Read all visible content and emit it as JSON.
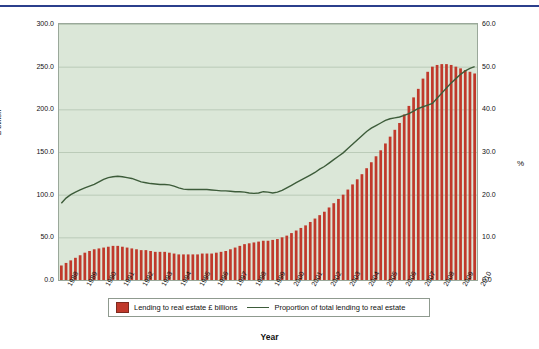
{
  "chart_data": {
    "type": "bar",
    "title": "",
    "xlabel": "Year",
    "ylabel": "£ billion",
    "ylabel_right": "%",
    "ylim": [
      0,
      300
    ],
    "ylim_right": [
      0,
      60
    ],
    "yticks": [
      "0.0",
      "50.0",
      "100.0",
      "150.0",
      "200.0",
      "250.0",
      "300.0"
    ],
    "yticks_right": [
      "0.0",
      "10.0",
      "20.0",
      "30.0",
      "40.0",
      "50.0",
      "60.0"
    ],
    "grid": true,
    "legend_position": "bottom",
    "categories": [
      "1988",
      "1989",
      "1990",
      "1991",
      "1992",
      "1993",
      "1994",
      "1995",
      "1996",
      "1997",
      "1998",
      "1999",
      "2000",
      "2001",
      "2002",
      "2003",
      "2004",
      "2005",
      "2006",
      "2007",
      "2008",
      "2009",
      "2010"
    ],
    "series": [
      {
        "name": "Lending to real estate £ billions",
        "type": "bar",
        "color": "#c0392b",
        "quarterly_values": [
          17,
          20,
          23,
          26,
          29,
          32,
          34,
          36,
          37,
          38,
          39,
          40,
          40,
          39,
          38,
          37,
          36,
          35,
          35,
          34,
          33,
          33,
          33,
          32,
          31,
          30,
          30,
          30,
          30,
          30,
          31,
          31,
          31,
          32,
          33,
          34,
          36,
          38,
          40,
          42,
          43,
          44,
          45,
          46,
          46,
          47,
          48,
          50,
          52,
          55,
          58,
          61,
          64,
          68,
          72,
          76,
          80,
          85,
          90,
          95,
          100,
          106,
          112,
          118,
          124,
          131,
          138,
          145,
          152,
          160,
          168,
          176,
          184,
          194,
          204,
          214,
          224,
          236,
          244,
          250,
          252,
          253,
          253,
          252,
          250,
          248,
          246,
          244,
          242
        ]
      },
      {
        "name": "Proportion of total lending to real estate",
        "type": "line",
        "color": "#3d5c3a",
        "quarterly_values": [
          18.0,
          19.2,
          20.0,
          20.6,
          21.1,
          21.6,
          22.0,
          22.4,
          23.0,
          23.6,
          24.0,
          24.2,
          24.3,
          24.2,
          24.0,
          23.8,
          23.4,
          23.0,
          22.8,
          22.6,
          22.5,
          22.4,
          22.4,
          22.3,
          22.0,
          21.6,
          21.3,
          21.2,
          21.2,
          21.2,
          21.2,
          21.2,
          21.1,
          21.0,
          20.9,
          20.9,
          20.8,
          20.7,
          20.7,
          20.6,
          20.4,
          20.3,
          20.4,
          20.7,
          20.6,
          20.4,
          20.6,
          21.0,
          21.6,
          22.2,
          22.8,
          23.4,
          24.0,
          24.6,
          25.2,
          26.0,
          26.6,
          27.4,
          28.2,
          29.0,
          29.8,
          30.8,
          31.8,
          32.8,
          33.8,
          34.8,
          35.6,
          36.2,
          36.8,
          37.4,
          37.8,
          38.0,
          38.2,
          38.6,
          39.0,
          39.6,
          40.2,
          40.6,
          41.0,
          41.4,
          42.6,
          43.8,
          45.0,
          46.2,
          47.2,
          48.2,
          49.0,
          49.6,
          50.0
        ]
      }
    ]
  },
  "legend": {
    "items": [
      {
        "label": "Lending to real estate £ billions",
        "marker": "bar-swatch",
        "color": "#c0392b"
      },
      {
        "label": "Proportion of total lending to real estate",
        "marker": "line-swatch",
        "color": "#3d5c3a"
      }
    ]
  }
}
